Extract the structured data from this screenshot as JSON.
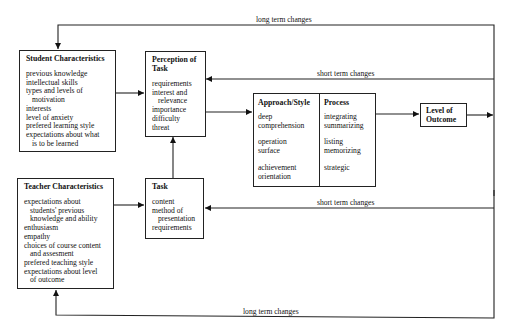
{
  "labels": {
    "long_top": "long term changes",
    "short_top": "short term changes",
    "short_bottom": "short term changes",
    "long_bottom": "long term changes"
  },
  "student": {
    "title": "Student Characteristics",
    "items": [
      {
        "text": "previous knowledge",
        "indent": false
      },
      {
        "text": "intellectual skills",
        "indent": false
      },
      {
        "text": "types and levels of",
        "indent": false
      },
      {
        "text": "motivation",
        "indent": true
      },
      {
        "text": "interests",
        "indent": false
      },
      {
        "text": "level of anxiety",
        "indent": false
      },
      {
        "text": "prefered learning  style",
        "indent": false
      },
      {
        "text": "expectations about what",
        "indent": false
      },
      {
        "text": "is to be learned",
        "indent": true
      }
    ]
  },
  "perception": {
    "title_1": "Perception of",
    "title_2": "Task",
    "items": [
      {
        "text": "requirements",
        "indent": false
      },
      {
        "text": "interest and",
        "indent": false
      },
      {
        "text": "relevance",
        "indent": true
      },
      {
        "text": "importance",
        "indent": false
      },
      {
        "text": "difficulty",
        "indent": false
      },
      {
        "text": "threat",
        "indent": false
      }
    ]
  },
  "approach": {
    "title": "Approach/Style",
    "groups": [
      [
        "deep",
        "comprehension"
      ],
      [
        "operation",
        "surface"
      ],
      [
        "achievement",
        "orientation"
      ]
    ]
  },
  "process": {
    "title": "Process",
    "groups": [
      [
        "integrating",
        "summarizing"
      ],
      [
        "listing",
        "memorizing"
      ],
      [
        "strategic"
      ]
    ]
  },
  "outcome": {
    "title_1": "Level of",
    "title_2": "Outcome"
  },
  "teacher": {
    "title": "Teacher Characteristics",
    "items": [
      {
        "text": "expectations about",
        "indent": false
      },
      {
        "text": "students' previous",
        "indent": true
      },
      {
        "text": "knowledge and ability",
        "indent": true
      },
      {
        "text": "enthusiasm",
        "indent": false
      },
      {
        "text": "empathy",
        "indent": false
      },
      {
        "text": "choices of course content",
        "indent": false
      },
      {
        "text": "and assesment",
        "indent": true
      },
      {
        "text": "prefered teaching style",
        "indent": false
      },
      {
        "text": "expectations about level",
        "indent": false
      },
      {
        "text": "of outcome",
        "indent": true
      }
    ]
  },
  "task": {
    "title": "Task",
    "items": [
      {
        "text": "content",
        "indent": false
      },
      {
        "text": "method of",
        "indent": false
      },
      {
        "text": "presentation",
        "indent": true
      },
      {
        "text": "requirements",
        "indent": false
      }
    ]
  }
}
